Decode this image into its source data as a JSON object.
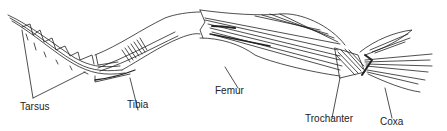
{
  "diagram": {
    "labels": {
      "tarsus": "Tarsus",
      "tibia": "Tibia",
      "femur": "Femur",
      "trochanter": "Trochanter",
      "coxa": "Coxa"
    },
    "colors": {
      "ink": "#222222",
      "background": "#ffffff"
    }
  }
}
